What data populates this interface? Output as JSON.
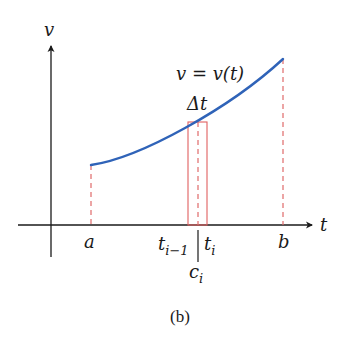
{
  "figure": {
    "caption": "(b)",
    "axes": {
      "y_label": "v",
      "x_label": "t"
    },
    "curve": {
      "label": "v = v(t)",
      "color": "#2f63b8"
    },
    "interval": {
      "start_label": "a",
      "end_label": "b"
    },
    "subinterval": {
      "width_label": "Δt",
      "left_label_base": "t",
      "left_label_sub": "i−1",
      "right_label_base": "t",
      "right_label_sub": "i",
      "sample_label_base": "c",
      "sample_label_sub": "i",
      "rect_color": "#e06060"
    },
    "dashed_line_color": "#e06a6a",
    "axis_color": "#1a1a1a"
  }
}
